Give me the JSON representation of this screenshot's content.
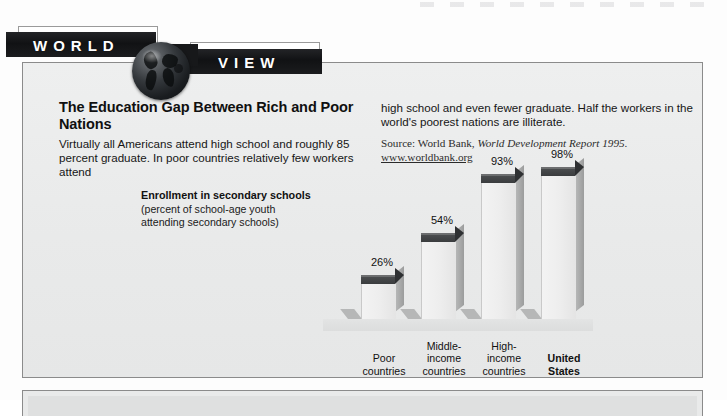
{
  "banner": {
    "word_left": "WORLD",
    "word_right": "VIEW",
    "globe_icon": "globe-icon"
  },
  "article": {
    "headline": "The Education Gap Between Rich and Poor Nations",
    "body_left": "Virtually all Americans attend high school and roughly 85 percent graduate. In poor countries relatively few workers attend",
    "body_right": "high school and even fewer graduate. Half the workers in the world's poorest nations are illiterate.",
    "source_prefix": "Source: World Bank, ",
    "source_title": "World Development Report 1995.",
    "source_url": "www.worldbank.org"
  },
  "chart_caption": {
    "title": "Enrollment in secondary schools",
    "subtitle": "(percent of school-age youth attending secondary schools)"
  },
  "chart_data": {
    "type": "bar",
    "title": "Enrollment in secondary schools",
    "subtitle": "(percent of school-age youth attending secondary schools)",
    "xlabel": "",
    "ylabel": "percent",
    "ylim": [
      0,
      100
    ],
    "grid": false,
    "legend": "none",
    "categories": [
      "Poor countries",
      "Middle-income countries",
      "High-income countries",
      "United States"
    ],
    "values": [
      26,
      54,
      93,
      98
    ],
    "value_labels": [
      "26%",
      "54%",
      "93%",
      "98%"
    ],
    "highlighted_category": "United States",
    "colors": {
      "bar_face": "#ededed",
      "bar_top": "#3d3f41",
      "bar_side": "#a9aaaa",
      "panel_background": "#ebecec"
    }
  },
  "chart_labels": [
    {
      "lines": [
        "Poor",
        "countries"
      ],
      "bold": false
    },
    {
      "lines": [
        "Middle-",
        "income",
        "countries"
      ],
      "bold": false
    },
    {
      "lines": [
        "High-",
        "income",
        "countries"
      ],
      "bold": false
    },
    {
      "lines": [
        "United",
        "States"
      ],
      "bold": true
    }
  ]
}
